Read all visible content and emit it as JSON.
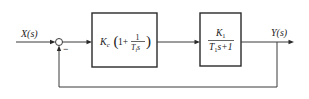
{
  "diagram": {
    "type": "feedback control loop block diagram",
    "input": {
      "label": "X(s)"
    },
    "output": {
      "label": "Y(s)"
    },
    "summing_junction": {
      "feedback_sign": "−"
    },
    "blocks": [
      {
        "id": "controller",
        "name": "PI controller",
        "gain": "K",
        "gain_sub": "c",
        "open_paren": "(",
        "one": "1+",
        "frac_num": "1",
        "frac_den_T": "T",
        "frac_den_sub": "i",
        "frac_den_s": "s",
        "close_paren": ")"
      },
      {
        "id": "plant",
        "name": "first-order plant",
        "num_K": "K",
        "num_sub": "1",
        "den_T": "T",
        "den_sub": "1",
        "den_rest": "s+1"
      }
    ],
    "feedback": {
      "type": "unity negative feedback"
    },
    "colors": {
      "line": "#3a3a3a",
      "text": "#222222",
      "background": "#ffffff"
    }
  }
}
